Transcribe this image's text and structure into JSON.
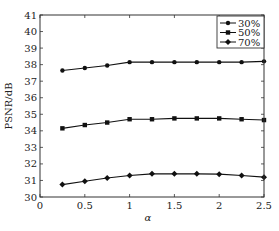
{
  "chart_data": {
    "type": "line",
    "title": "",
    "xlabel": "α",
    "ylabel": "PSNR/dB",
    "xlim": [
      0,
      2.5
    ],
    "ylim": [
      30,
      41
    ],
    "xticks": [
      0,
      0.5,
      1,
      1.5,
      2,
      2.5
    ],
    "xtick_labels": [
      "0",
      "0.5",
      "1",
      "1.5",
      "2",
      "2.5"
    ],
    "yticks": [
      30,
      31,
      32,
      33,
      34,
      35,
      36,
      37,
      38,
      39,
      40,
      41
    ],
    "ytick_labels": [
      "30",
      "31",
      "32",
      "33",
      "34",
      "35",
      "36",
      "37",
      "38",
      "39",
      "40",
      "41"
    ],
    "grid": false,
    "legend_position": "upper right",
    "x": [
      0.25,
      0.5,
      0.75,
      1.0,
      1.25,
      1.5,
      1.75,
      2.0,
      2.25,
      2.5
    ],
    "series": [
      {
        "name": "30%",
        "marker": "circle",
        "values": [
          37.65,
          37.8,
          37.95,
          38.15,
          38.15,
          38.15,
          38.15,
          38.15,
          38.15,
          38.2
        ]
      },
      {
        "name": "50%",
        "marker": "square",
        "values": [
          34.15,
          34.35,
          34.5,
          34.7,
          34.7,
          34.75,
          34.75,
          34.75,
          34.7,
          34.65
        ]
      },
      {
        "name": "70%",
        "marker": "diamond",
        "values": [
          30.75,
          30.95,
          31.15,
          31.3,
          31.4,
          31.4,
          31.4,
          31.38,
          31.3,
          31.2
        ]
      }
    ]
  },
  "colors": {
    "line": "#111111",
    "axis": "#333333",
    "background": "#ffffff"
  }
}
